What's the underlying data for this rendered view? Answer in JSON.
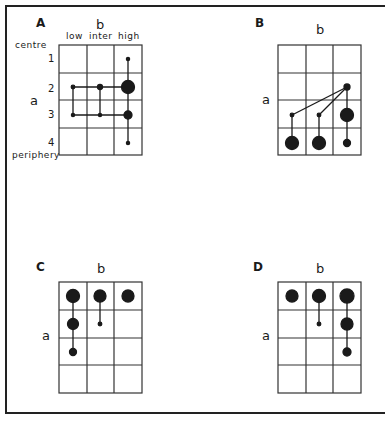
{
  "panels": {
    "A": {
      "letter": "A",
      "axis_b": "b",
      "axis_a": "a",
      "col_labels": [
        "low",
        "inter",
        "high"
      ],
      "row_labels": [
        "1",
        "2",
        "3",
        "4"
      ],
      "top_label": "centre",
      "bottom_label": "periphery"
    },
    "B": {
      "letter": "B",
      "axis_b": "b",
      "axis_a": "a"
    },
    "C": {
      "letter": "C",
      "axis_b": "b",
      "axis_a": "a"
    },
    "D": {
      "letter": "D",
      "axis_b": "b",
      "axis_a": "a"
    }
  },
  "colors": {
    "ink": "#1a1a1a",
    "grid": "#333333",
    "background": "#ffffff"
  }
}
